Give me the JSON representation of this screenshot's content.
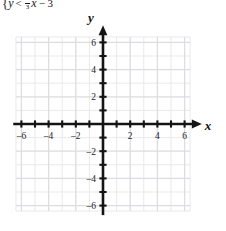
{
  "equation": {
    "brace": "{",
    "lhs": "y",
    "relation": "<",
    "fraction_numerator": "1",
    "fraction_denominator": "3",
    "variable": "x",
    "constant": "− 3",
    "full_text": "{ y < 1/3 x − 3"
  },
  "chart_data": {
    "type": "scatter",
    "title": "",
    "xlabel": "x",
    "ylabel": "y",
    "xlim": [
      -6.5,
      6.5
    ],
    "ylim": [
      -6.5,
      6.5
    ],
    "grid": true,
    "grid_step_minor": 1,
    "grid_step_major": 2,
    "x_ticks": [
      -6,
      -5,
      -4,
      -3,
      -2,
      -1,
      1,
      2,
      3,
      4,
      5,
      6
    ],
    "y_ticks": [
      -6,
      -5,
      -4,
      -3,
      -2,
      -1,
      1,
      2,
      3,
      4,
      5,
      6
    ],
    "x_tick_labels": [
      "–6",
      "–4",
      "–2",
      "2",
      "4",
      "6"
    ],
    "x_tick_label_values": [
      -6,
      -4,
      -2,
      2,
      4,
      6
    ],
    "y_tick_labels": [
      "6",
      "4",
      "2",
      "–2",
      "–4",
      "–6"
    ],
    "y_tick_label_values": [
      6,
      4,
      2,
      -2,
      -4,
      -6
    ],
    "series": [],
    "values": [],
    "x": [],
    "legend": [],
    "annotations": [],
    "note": "empty coordinate plane, no curve plotted"
  },
  "colors": {
    "axis": "#141414",
    "grid_minor": "#e9e9ec",
    "grid_major": "#dcdce1",
    "label": "#232323",
    "background": "#ffffff"
  },
  "axis_labels": {
    "x_axis_name": "x",
    "y_axis_name": "y"
  }
}
